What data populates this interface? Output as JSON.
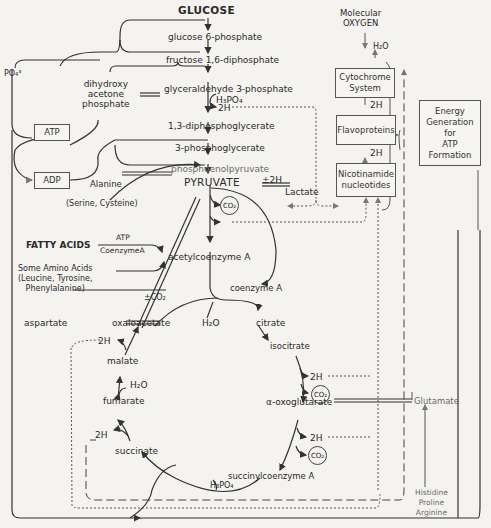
{
  "glycolysis": {
    "glucose": "GLUCOSE",
    "g6p": "glucose 6-phosphate",
    "f16dp": "fructose 1,6-diphosphate",
    "dhap": [
      "dihydroxy",
      "acetone",
      "phosphate"
    ],
    "g3p": "glyceraldehyde 3-phosphate",
    "h3po4": "H₃PO₄",
    "two_h": "2H",
    "dpg13": "1,3-diphosphoglycerate",
    "pg3": "3-phosphoglycerate",
    "pep": "phosphoenolpyruvate",
    "pyruvate": "PYRUVATE"
  },
  "side": {
    "po4": "PO₄³",
    "atp": "ATP",
    "adp": "ADP",
    "alanine": "Alanine",
    "serine_cysteine": "(Serine, Cysteine)",
    "pm2h": "±2H",
    "lactate": "Lactate",
    "fatty_acids": "FATTY ACIDS",
    "atp_small": "ATP",
    "coenzyme_a_small": "CoenzymeA",
    "amino_acids": [
      "Some Amino Acids",
      "(Leucine, Tyrosine,",
      "Phenylalanine)"
    ],
    "pm_co2": "±CO₂",
    "glutamate": "Glutamate",
    "glutamate_sources": [
      "Histidine",
      "Proline",
      "Arginine"
    ]
  },
  "tca": {
    "acetyl_coa": "acetylcoenzyme A",
    "coenzyme_a": "coenzyme A",
    "h2o_1": "H₂O",
    "citrate": "citrate",
    "isocitrate": "isocitrate",
    "alpha_kg": "α-oxoglutarate",
    "succinyl_coa": "succinylcoenzyme A",
    "h3po4": "H₃PO₄",
    "succinate": "succinate",
    "fumarate": "fumarate",
    "h2o_2": "H₂O",
    "malate": "malate",
    "oxaloacetate": "oxaloacetate",
    "aspartate": "aspartate",
    "two_h": "2H",
    "co2": "CO₂"
  },
  "respiration": {
    "molecular": "Molecular",
    "oxygen": "OXYGEN",
    "h2o": "H₂O",
    "cytochrome": [
      "Cytochrome",
      "System"
    ],
    "two_h": "2H",
    "flavoproteins": "Flavoproteins",
    "nicotinamide": [
      "Nicotinamide",
      "nucleotides"
    ],
    "energy": [
      "Energy",
      "Generation",
      "for",
      "ATP",
      "Formation"
    ]
  }
}
